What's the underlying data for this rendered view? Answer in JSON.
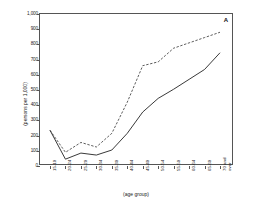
{
  "panel": {
    "letter": "A"
  },
  "axes": {
    "ylabel": "(persons per 1,000)",
    "xlabel": "(age group)",
    "yticks": [
      "0",
      "100",
      "200",
      "300",
      "400",
      "500",
      "600",
      "700",
      "800",
      "900",
      "1,000"
    ]
  },
  "chart_data": {
    "type": "line",
    "title": "",
    "xlabel": "(age group)",
    "ylabel": "(persons per 1,000)",
    "ylim": [
      0,
      1000
    ],
    "ytick_step": 100,
    "grid": false,
    "legend": "none",
    "panel_label": "A",
    "categories": [
      "15-19",
      "20-24",
      "25-29",
      "30-34",
      "35-39",
      "40-44",
      "45-49",
      "50-54",
      "55-59",
      "60-64",
      "65-69",
      "70 and over"
    ],
    "category_multiline": {
      "70 and over": [
        "70 and",
        "over"
      ]
    },
    "series": [
      {
        "name": "dashed-series",
        "style": "dashed",
        "values": [
          235,
          90,
          155,
          125,
          215,
          420,
          660,
          685,
          775,
          810,
          845,
          880
        ]
      },
      {
        "name": "solid-series",
        "style": "solid",
        "values": [
          235,
          45,
          85,
          72,
          105,
          215,
          355,
          445,
          505,
          570,
          635,
          745
        ]
      }
    ]
  }
}
